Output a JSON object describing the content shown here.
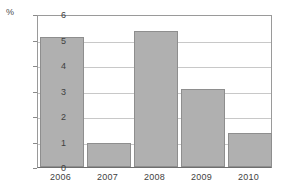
{
  "chart_data": {
    "type": "bar",
    "title": "",
    "xlabel": "",
    "ylabel": "%",
    "unit_label": "%",
    "categories": [
      "2006",
      "2007",
      "2008",
      "2009",
      "2010"
    ],
    "values": [
      5.1,
      0.95,
      5.35,
      3.05,
      1.35
    ],
    "series": [
      {
        "name": "",
        "values": [
          5.1,
          0.95,
          5.35,
          3.05,
          1.35
        ]
      }
    ],
    "ylim": [
      0,
      6
    ],
    "xlim": null,
    "y_ticks": [
      "0",
      "1",
      "2",
      "3",
      "4",
      "5",
      "6"
    ],
    "y_tick_values": [
      0,
      1,
      2,
      3,
      4,
      5,
      6
    ],
    "grid": true,
    "grid_axis": "y",
    "legend": null,
    "legend_position": "none",
    "annotations": [],
    "colors": {
      "bar_fill": "#b0b0b0",
      "bar_border": "#8e8e8e",
      "gridline": "#c8c8c8",
      "axis": "#6e6e6e",
      "frame": "#9a9a9a",
      "text": "#3f3f3f",
      "background": "#ffffff"
    }
  }
}
